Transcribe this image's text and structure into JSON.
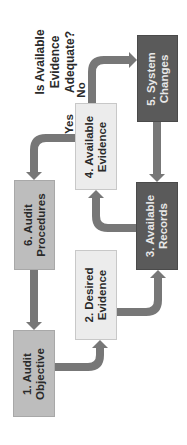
{
  "diagram": {
    "question": {
      "line1": "Is Available",
      "line2": "Evidence",
      "line3": "Adequate?"
    },
    "branch_yes": "Yes",
    "branch_no": "No",
    "boxes": [
      {
        "id": 1,
        "line1": "1. Audit",
        "line2": "Objective",
        "shade": "mid"
      },
      {
        "id": 2,
        "line1": "2. Desired",
        "line2": "Evidence",
        "shade": "light"
      },
      {
        "id": 3,
        "line1": "3. Available",
        "line2": "Records",
        "shade": "dark"
      },
      {
        "id": 4,
        "line1": "4. Available",
        "line2": "Evidence",
        "shade": "light"
      },
      {
        "id": 5,
        "line1": "5. System",
        "line2": "Changes",
        "shade": "dark"
      },
      {
        "id": 6,
        "line1": "6. Audit",
        "line2": "Procedures",
        "shade": "mid"
      }
    ],
    "flows": [
      {
        "from": 1,
        "to": 2
      },
      {
        "from": 2,
        "to": 3
      },
      {
        "from": 3,
        "to": 4
      },
      {
        "from": 4,
        "to": 5,
        "label": "No"
      },
      {
        "from": 4,
        "to": 6,
        "label": "Yes"
      },
      {
        "from": 5,
        "to": 3
      },
      {
        "from": 6,
        "to": 1
      }
    ],
    "colors": {
      "arrow": "#777777",
      "dark": "#5a5a5a",
      "mid": "#bdbdbd",
      "light": "#ececec"
    }
  }
}
